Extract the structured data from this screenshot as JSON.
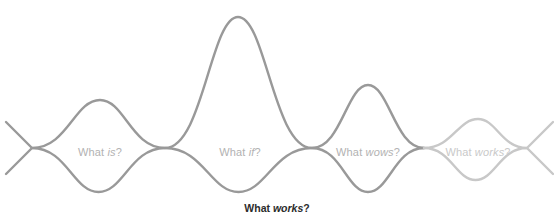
{
  "diagram": {
    "type": "double-diamond-wave",
    "background_color": "#ffffff",
    "stroke_color_primary": "#999999",
    "stroke_color_faded": "#c8c8c8",
    "label_color": "#b2b2b2",
    "label_color_faded": "#c9c9c9",
    "caption_color": "#2b2b2b",
    "stroke_width": 2.4,
    "baseline_y": 148,
    "node_x_positions": [
      32,
      165,
      312,
      424,
      527
    ],
    "lobes": [
      {
        "id": "what-is",
        "label_prefix": "What ",
        "label_emphasis": "is",
        "label_suffix": "?",
        "label_x": 100,
        "label_y": 152,
        "peak_x": 100,
        "peak_y": 100,
        "trough_y": 192,
        "start_x": 32,
        "end_x": 165,
        "faded": false
      },
      {
        "id": "what-if",
        "label_prefix": "What ",
        "label_emphasis": "if",
        "label_suffix": "?",
        "label_x": 240,
        "label_y": 152,
        "peak_x": 238,
        "peak_y": 17,
        "trough_y": 192,
        "start_x": 165,
        "end_x": 312,
        "faded": false
      },
      {
        "id": "what-wows",
        "label_prefix": "What ",
        "label_emphasis": "wows",
        "label_suffix": "?",
        "label_x": 368,
        "label_y": 152,
        "peak_x": 368,
        "peak_y": 85,
        "trough_y": 192,
        "start_x": 312,
        "end_x": 424,
        "faded": false
      },
      {
        "id": "what-works",
        "label_prefix": "What ",
        "label_emphasis": "works",
        "label_suffix": "?",
        "label_x": 478,
        "label_y": 152,
        "peak_x": 478,
        "peak_y": 119,
        "trough_y": 180,
        "start_x": 424,
        "end_x": 527,
        "faded": true
      }
    ],
    "caption": {
      "prefix": "What ",
      "emphasis": "works",
      "suffix": "?"
    }
  }
}
